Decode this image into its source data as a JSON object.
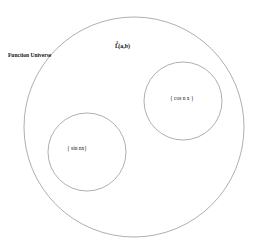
{
  "diagram": {
    "type": "set-containment",
    "universe_label": "Function Universe",
    "space_label": "L",
    "space_superscript": "2",
    "space_suffix": "(a,b)",
    "sets": [
      {
        "name": "cos-set",
        "label": "{ cos n x }"
      },
      {
        "name": "sin-set",
        "label": "{ sin nx}"
      }
    ],
    "colors": {
      "background": "#ffffff",
      "circle_stroke": "#9a9a9a",
      "text": "#111111"
    },
    "geometry": {
      "outer_circle": {
        "cx": 134,
        "cy": 127,
        "r": 110
      },
      "cos_circle": {
        "cx": 183,
        "cy": 101,
        "r": 39
      },
      "sin_circle": {
        "cx": 87,
        "cy": 152,
        "r": 39
      }
    }
  }
}
